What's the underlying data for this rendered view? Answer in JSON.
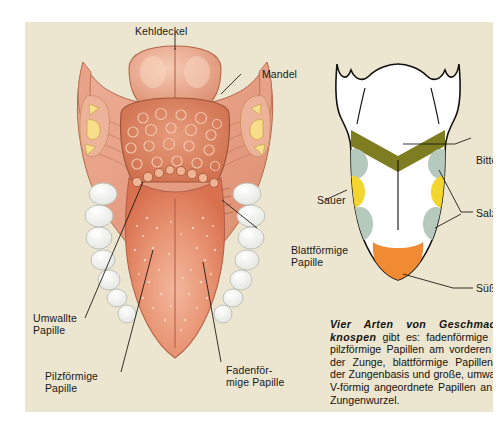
{
  "figure": {
    "background_color": "#ece5cf",
    "page_color": "#ffffff"
  },
  "anatomy_labels": [
    {
      "id": "kehldeckel",
      "text": "Kehldeckel"
    },
    {
      "id": "mandel",
      "text": "Mandel"
    },
    {
      "id": "blattfoermige-papille",
      "text": "Blattförmige\nPapille"
    },
    {
      "id": "umwallte-papille",
      "text": "Umwallte\nPapille"
    },
    {
      "id": "pilzfoermige-papille",
      "text": "Pilzförmige\nPapille"
    },
    {
      "id": "fadenfoermige-papille",
      "text": "Fadenför-\nmige Papille"
    }
  ],
  "taste_map": {
    "labels": [
      {
        "id": "bitter",
        "text": "Bitter",
        "color": "#7f7d22"
      },
      {
        "id": "salzig",
        "text": "Salzig",
        "color": "#b6c9bd"
      },
      {
        "id": "sauer",
        "text": "Sauer",
        "color": "#f2d52e"
      },
      {
        "id": "suess",
        "text": "Süß",
        "color": "#f08a33"
      }
    ]
  },
  "caption": {
    "lead": "Vier Arten von Geschmacks­knospen",
    "body": " gibt es: fadenförmige und pilzförmige Papillen am vorderen Teil der Zunge, blattförmige Papillen an der Zungenbasis und große, umwallte, V-förmig angeordnete Papillen an der Zungenwurzel."
  },
  "colors": {
    "tongue_pink": "#e3805f",
    "tongue_light": "#f0a98c",
    "mucosa": "#e9a58c",
    "tooth": "#f4f3ee",
    "bitter": "#7f7d22",
    "salzig": "#b6c9bd",
    "sauer": "#f2d52e",
    "suess": "#f08a33",
    "ink": "#1a1a1a"
  }
}
